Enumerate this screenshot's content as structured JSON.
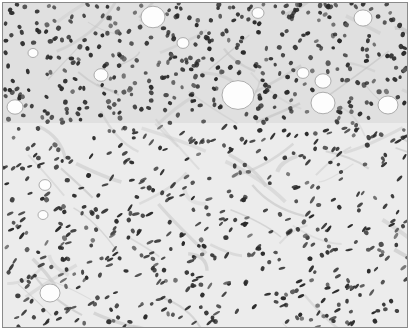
{
  "image": {
    "kind": "histology-micrograph",
    "description": "Grayscale microscopic tissue section with dense dark nuclei, fibrous stroma and round fat vacuoles",
    "colors": {
      "background": "#ececec",
      "stroma": "#c9c9c9",
      "nucleus": "#2b2b2b",
      "nucleus_light": "#5a5a5a",
      "vacuole": "#fdfdfd",
      "border": "#8a8a8a"
    }
  }
}
